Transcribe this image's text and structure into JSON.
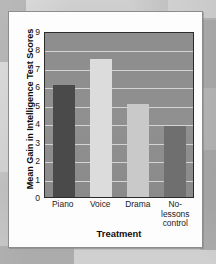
{
  "figure": {
    "card_background": "#fdfdfd",
    "page_background": "#bdbdbd",
    "plot_background": "#8e8e8e",
    "gridline_color": "#d4d4d4",
    "axis_color": "#2b2b2b"
  },
  "chart_data": {
    "type": "bar",
    "title": "",
    "subtitle": "",
    "xlabel": "Treatment",
    "ylabel": "Mean Gain in Intelligence Test Scores",
    "categories": [
      "Piano",
      "Voice",
      "Drama",
      "No-lessons control"
    ],
    "values": [
      6.1,
      7.5,
      5.05,
      3.85
    ],
    "bar_colors": [
      "#4a4a4a",
      "#dcdcdc",
      "#c9c9c9",
      "#6f6f6f"
    ],
    "ylim": [
      0,
      9
    ],
    "ytick_labels": [
      "9",
      "8",
      "7",
      "6",
      "5",
      "4",
      "3",
      "2",
      "1",
      "0"
    ],
    "yticks": [
      9,
      8,
      7,
      6,
      5,
      4,
      3,
      2,
      1,
      0
    ],
    "grid": true,
    "grid_axis": "y",
    "legend": false,
    "legend_position": "none",
    "series": [
      {
        "name": "Mean gain",
        "values": [
          6.1,
          7.5,
          5.05,
          3.85
        ]
      }
    ]
  }
}
